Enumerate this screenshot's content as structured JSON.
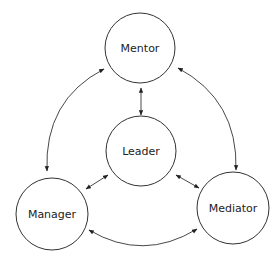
{
  "diagram": {
    "type": "relationship-cycle",
    "colors": {
      "stroke": "#333333",
      "text": "#222222",
      "background": "#ffffff"
    },
    "nodes": [
      {
        "id": "mentor",
        "label": "Mentor"
      },
      {
        "id": "leader",
        "label": "Leader"
      },
      {
        "id": "manager",
        "label": "Manager"
      },
      {
        "id": "mediator",
        "label": "Mediator"
      }
    ],
    "edges": [
      {
        "from": "mentor",
        "to": "leader",
        "direction": "both"
      },
      {
        "from": "mentor",
        "to": "manager",
        "direction": "both"
      },
      {
        "from": "mentor",
        "to": "mediator",
        "direction": "both"
      },
      {
        "from": "leader",
        "to": "manager",
        "direction": "both"
      },
      {
        "from": "leader",
        "to": "mediator",
        "direction": "both"
      },
      {
        "from": "manager",
        "to": "mediator",
        "direction": "both"
      }
    ]
  }
}
